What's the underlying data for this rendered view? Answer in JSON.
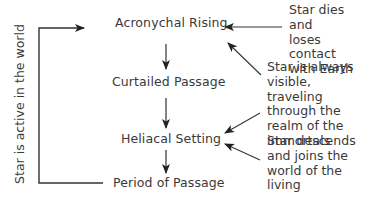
{
  "diagram": {
    "stages": [
      {
        "id": "acronychal-rising",
        "label": "Acronychal Rising"
      },
      {
        "id": "curtailed-passage",
        "label": "Curtailed Passage"
      },
      {
        "id": "heliacal-setting",
        "label": "Heliacal Setting"
      },
      {
        "id": "period-of-passage",
        "label": "Period of Passage"
      }
    ],
    "side_label": "Star is active in the world",
    "notes": [
      {
        "id": "note-dies",
        "text": "Star dies and\nloses contact\nwith Earth",
        "points_to": "acronychal-rising"
      },
      {
        "id": "note-visible",
        "text": "Star is always\nvisible, traveling\nthrough the\nrealm of the\nimmortals",
        "points_to": [
          "acronychal-rising",
          "heliacal-setting"
        ]
      },
      {
        "id": "note-descends",
        "text": "Star descends\nand joins the\nworld of the\nliving",
        "points_to": "heliacal-setting"
      }
    ],
    "colors": {
      "line": "#333333",
      "text": "#3a3a3a",
      "background": "#ffffff"
    }
  }
}
